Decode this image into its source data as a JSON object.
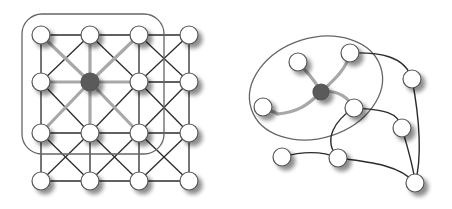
{
  "diagram": {
    "colors": {
      "node_fill": "#ffffff",
      "node_stroke": "#555555",
      "center_fill": "#5a5a5a",
      "edge": "#2b2b2b",
      "highlight_edge": "#a8a8a8",
      "region": "#666666"
    },
    "left_graph": {
      "name": "grid-graph",
      "columns": 4,
      "rows": 4,
      "center_node": [
        1,
        1
      ],
      "neighborhood": "rounded-rectangle covering the 3x3 block around the center node"
    },
    "right_graph": {
      "name": "irregular-graph",
      "nodes": [
        "center",
        "top-left",
        "top",
        "left",
        "right-of-center",
        "far-right-upper",
        "right-mid",
        "bottom-left",
        "bottom-mid",
        "bottom-right"
      ],
      "center_node": "center",
      "highlighted_neighbors": [
        "top-left",
        "top",
        "left",
        "right-of-center"
      ],
      "edges": [
        [
          "center",
          "top-left"
        ],
        [
          "center",
          "top"
        ],
        [
          "center",
          "left"
        ],
        [
          "center",
          "right-of-center"
        ],
        [
          "top",
          "far-right-upper"
        ],
        [
          "far-right-upper",
          "bottom-right"
        ],
        [
          "right-of-center",
          "right-mid"
        ],
        [
          "right-of-center",
          "bottom-mid"
        ],
        [
          "right-mid",
          "bottom-right"
        ],
        [
          "bottom-left",
          "bottom-mid"
        ],
        [
          "bottom-mid",
          "bottom-right"
        ]
      ],
      "neighborhood": "ellipse around center node and its direct neighbors"
    }
  }
}
